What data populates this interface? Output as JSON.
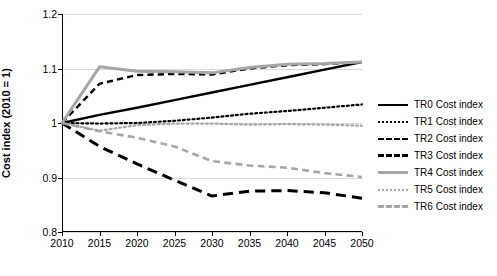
{
  "chart_data": {
    "type": "line",
    "title": "",
    "xlabel": "",
    "ylabel": "Cost index (2010 = 1)",
    "x": [
      2010,
      2015,
      2020,
      2025,
      2030,
      2035,
      2040,
      2045,
      2050
    ],
    "xlim": [
      2010,
      2050
    ],
    "ylim": [
      0.8,
      1.2
    ],
    "xticks": [
      "2010",
      "2015",
      "2020",
      "2025",
      "2030",
      "2035",
      "2040",
      "2045",
      "2050"
    ],
    "yticks": [
      "0.8",
      "0.9",
      "1",
      "1.1",
      "1.2"
    ],
    "grid": "horizontal",
    "legend_position": "right",
    "series": [
      {
        "name": "TR0 Cost index",
        "color": "#000000",
        "style": "solid",
        "width": 2.4,
        "values": [
          1.0,
          1.015,
          1.028,
          1.042,
          1.056,
          1.07,
          1.084,
          1.098,
          1.112
        ]
      },
      {
        "name": "TR1 Cost index",
        "color": "#000000",
        "style": "dotted",
        "width": 2.2,
        "values": [
          1.0,
          0.999,
          1.0,
          1.004,
          1.01,
          1.017,
          1.022,
          1.028,
          1.034
        ]
      },
      {
        "name": "TR2 Cost index",
        "color": "#000000",
        "style": "dashed",
        "width": 2.4,
        "values": [
          1.0,
          1.072,
          1.088,
          1.09,
          1.089,
          1.1,
          1.106,
          1.108,
          1.112
        ]
      },
      {
        "name": "TR3 Cost index",
        "color": "#000000",
        "style": "dashed-long",
        "width": 3.0,
        "values": [
          1.0,
          0.957,
          0.925,
          0.895,
          0.866,
          0.875,
          0.876,
          0.872,
          0.862
        ]
      },
      {
        "name": "TR4 Cost index",
        "color": "#a6a6a6",
        "style": "solid",
        "width": 3.0,
        "values": [
          1.0,
          1.103,
          1.095,
          1.094,
          1.092,
          1.102,
          1.108,
          1.109,
          1.112
        ]
      },
      {
        "name": "TR5 Cost index",
        "color": "#a6a6a6",
        "style": "dotted",
        "width": 2.2,
        "values": [
          1.0,
          0.986,
          0.996,
          0.999,
          0.999,
          0.997,
          0.998,
          0.997,
          0.995
        ]
      },
      {
        "name": "TR6 Cost index",
        "color": "#a6a6a6",
        "style": "dashed",
        "width": 2.6,
        "values": [
          1.0,
          0.985,
          0.973,
          0.957,
          0.93,
          0.922,
          0.918,
          0.908,
          0.901
        ]
      }
    ]
  }
}
